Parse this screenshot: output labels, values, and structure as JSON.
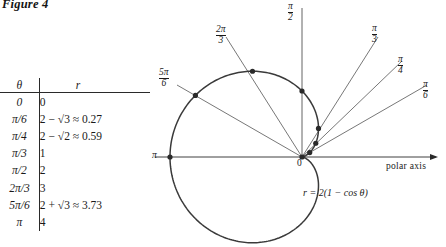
{
  "figure": {
    "title": "Figure 4",
    "equation_label": "r = 2(1 − cos θ)",
    "polar_axis_label": "polar axis",
    "origin_label": "0",
    "pi_axis_label": "π"
  },
  "table": {
    "headers": {
      "theta": "θ",
      "r": "r"
    },
    "rows": [
      {
        "theta": "0",
        "r": "0"
      },
      {
        "theta": "π/6",
        "r": "2 − √3 ≈ 0.27"
      },
      {
        "theta": "π/4",
        "r": "2 − √2 ≈ 0.59"
      },
      {
        "theta": "π/3",
        "r": "1"
      },
      {
        "theta": "π/2",
        "r": "2"
      },
      {
        "theta": "2π/3",
        "r": "3"
      },
      {
        "theta": "5π/6",
        "r": "2 + √3 ≈ 3.73"
      },
      {
        "theta": "π",
        "r": "4"
      }
    ]
  },
  "ray_labels": [
    {
      "name": "pi-over-2",
      "num": "π",
      "den": "2"
    },
    {
      "name": "2pi-over-3",
      "num": "2π",
      "den": "3"
    },
    {
      "name": "5pi-over-6",
      "num": "5π",
      "den": "6"
    },
    {
      "name": "pi-over-3",
      "num": "π",
      "den": "3"
    },
    {
      "name": "pi-over-4",
      "num": "π",
      "den": "4"
    },
    {
      "name": "pi-over-6",
      "num": "π",
      "den": "6"
    }
  ],
  "chart_data": {
    "type": "line",
    "subtype": "polar-cardioid",
    "title": "Figure 4",
    "equation": "r = 2(1 - cos(theta))",
    "xlabel": "polar axis",
    "ylabel": "",
    "grid": false,
    "legend": false,
    "theta_units": "radians",
    "r_max": 4,
    "pole": {
      "x": 302,
      "y": 157
    },
    "pixels_per_unit_r": 33,
    "points": [
      {
        "theta": "0",
        "theta_value": 0.0,
        "r": 0.0
      },
      {
        "theta": "pi/6",
        "theta_value": 0.5236,
        "r": 0.27
      },
      {
        "theta": "pi/4",
        "theta_value": 0.7854,
        "r": 0.59
      },
      {
        "theta": "pi/3",
        "theta_value": 1.0472,
        "r": 1.0
      },
      {
        "theta": "pi/2",
        "theta_value": 1.5708,
        "r": 2.0
      },
      {
        "theta": "2pi/3",
        "theta_value": 2.0944,
        "r": 3.0
      },
      {
        "theta": "5pi/6",
        "theta_value": 2.618,
        "r": 3.73
      },
      {
        "theta": "pi",
        "theta_value": 3.1416,
        "r": 4.0
      }
    ],
    "rays_drawn": [
      "pi/6",
      "pi/4",
      "pi/3",
      "pi/2",
      "2pi/3",
      "5pi/6",
      "pi"
    ],
    "colors": {
      "curve": "#3a3a3a",
      "axis": "#2a2a2a",
      "marker": "#2a2a2a"
    }
  }
}
